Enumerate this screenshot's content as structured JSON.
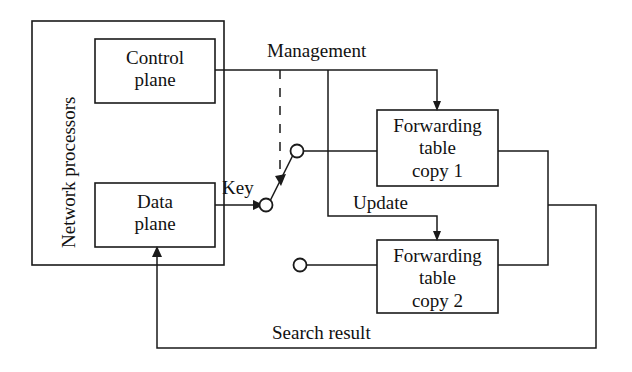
{
  "diagram": {
    "type": "block-diagram",
    "stroke_color": "#1a1a1a",
    "background_color": "#ffffff",
    "containers": [
      {
        "id": "network-processors",
        "label": "Network processors",
        "orientation": "vertical-label"
      }
    ],
    "boxes": [
      {
        "id": "control-plane",
        "label_line1": "Control",
        "label_line2": "plane"
      },
      {
        "id": "data-plane",
        "label_line1": "Data",
        "label_line2": "plane"
      },
      {
        "id": "forwarding-table-copy-1",
        "label_line1": "Forwarding",
        "label_line2": "table",
        "label_line3": "copy 1"
      },
      {
        "id": "forwarding-table-copy-2",
        "label_line1": "Forwarding",
        "label_line2": "table",
        "label_line3": "copy 2"
      }
    ],
    "edge_labels": {
      "management": "Management",
      "key": "Key",
      "update": "Update",
      "search_result": "Search result"
    },
    "switch": {
      "id": "table-select-switch",
      "pivot_label": "",
      "pole_count": 2,
      "selected_contact": "forwarding-table-copy-1",
      "control_line_style": "dashed"
    }
  }
}
